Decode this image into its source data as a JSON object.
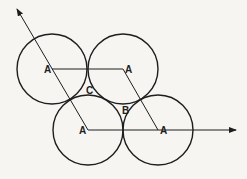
{
  "diagram": {
    "colors": {
      "stroke": "#1e1e1e",
      "background": "#f6f5f2"
    },
    "circles": [
      {
        "id": "top-left",
        "cx": 52,
        "cy": 69,
        "r": 35
      },
      {
        "id": "top-right",
        "cx": 123,
        "cy": 69,
        "r": 35
      },
      {
        "id": "bottom-left",
        "cx": 88,
        "cy": 130,
        "r": 35
      },
      {
        "id": "bottom-right",
        "cx": 158,
        "cy": 130,
        "r": 35
      }
    ],
    "labels": {
      "a_top_left": "A",
      "a_top_right": "A",
      "a_bottom_left": "A",
      "a_bottom_right": "A",
      "b": "B",
      "c": "C"
    }
  }
}
